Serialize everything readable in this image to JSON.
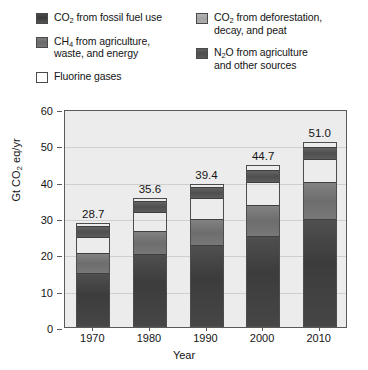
{
  "legend": {
    "columns": [
      {
        "items": [
          {
            "key": "fossil",
            "swatch": "sw-fossil",
            "label": "CO2 from fossil fuel use",
            "label_html": "CO₂ from fossil fuel use"
          },
          {
            "key": "ch4",
            "swatch": "sw-ch4",
            "label": "CH4 from agriculture,\nwaste, and energy",
            "label_html": "CH₄ from agriculture,\nwaste, and energy"
          },
          {
            "key": "fluorine",
            "swatch": "sw-fluor",
            "label": "Fluorine gases",
            "label_html": "Fluorine gases"
          }
        ]
      },
      {
        "items": [
          {
            "key": "deforestation",
            "swatch": "sw-defor",
            "label": "CO2 from deforestation,\ndecay, and peat",
            "label_html": "CO₂ from deforestation,\ndecay, and peat"
          },
          {
            "key": "n2o",
            "swatch": "sw-n2o",
            "label": "N2O from agriculture\nand other sources",
            "label_html": "N₂O from agriculture\nand other sources"
          }
        ]
      }
    ]
  },
  "axes": {
    "y_title": "Gt CO2 eq/yr",
    "y_ticks": [
      "0",
      "10",
      "20",
      "30",
      "40",
      "50",
      "60"
    ],
    "x_title": "Year",
    "x_ticks": [
      "1970",
      "1980",
      "1990",
      "2000",
      "2010"
    ]
  },
  "chart_data": {
    "type": "bar",
    "stacked": true,
    "title": "",
    "xlabel": "Year",
    "ylabel": "Gt CO2 eq/yr",
    "ylim": [
      0,
      60
    ],
    "ytick_step": 10,
    "grid": true,
    "legend_position": "top",
    "categories": [
      "1970",
      "1980",
      "1990",
      "2000",
      "2010"
    ],
    "series": [
      {
        "name": "CO2 from fossil fuel use",
        "key": "fossil",
        "color": "#434343",
        "values": [
          14.9,
          20.0,
          22.5,
          25.0,
          29.8
        ]
      },
      {
        "name": "CH4 from agriculture, waste, and energy",
        "key": "ch4",
        "color": "#757575",
        "values": [
          5.6,
          6.5,
          7.5,
          8.8,
          10.2
        ]
      },
      {
        "name": "CO2 from deforestation, decay, and peat",
        "key": "deforestation",
        "color": "#adadad",
        "values": [
          4.5,
          5.3,
          5.7,
          6.4,
          6.4
        ]
      },
      {
        "name": "N2O from agriculture and other sources",
        "key": "n2o",
        "color": "#585858",
        "values": [
          3.0,
          3.2,
          3.2,
          3.4,
          3.5
        ]
      },
      {
        "name": "Fluorine gases",
        "key": "fluorine",
        "color": "#fbfbfb",
        "values": [
          0.7,
          0.6,
          0.5,
          1.1,
          1.1
        ]
      }
    ],
    "totals": [
      28.7,
      35.6,
      39.4,
      44.7,
      51.0
    ],
    "total_labels": [
      "28.7",
      "35.6",
      "39.4",
      "44.7",
      "51.0"
    ]
  },
  "colors": {
    "plot_background": "#ececec",
    "gridline": "#cfcfcf",
    "axis": "#5a5a5a",
    "text": "#141414"
  }
}
